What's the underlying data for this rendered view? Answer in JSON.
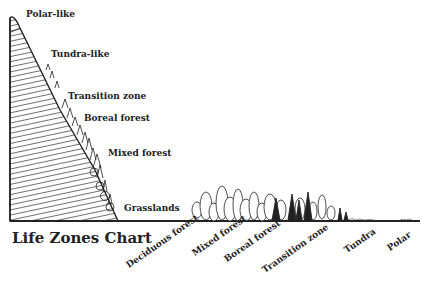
{
  "title": "Life Zones Chart",
  "slope_labels": [
    {
      "label": "Polar-like",
      "x": 26,
      "y": 9
    },
    {
      "label": "Tundra-like",
      "x": 51,
      "y": 49
    },
    {
      "label": "Transition zone",
      "x": 68,
      "y": 91
    },
    {
      "label": "Boreal forest",
      "x": 84,
      "y": 113
    },
    {
      "label": "Mixed forest",
      "x": 108,
      "y": 148
    },
    {
      "label": "Grasslands",
      "x": 124,
      "y": 203
    }
  ],
  "axis_labels": [
    {
      "label": "Deciduous forest",
      "x": 130,
      "y": 272
    },
    {
      "label": "Mixed forest",
      "x": 196,
      "y": 260
    },
    {
      "label": "Boreal forest",
      "x": 225,
      "y": 266
    },
    {
      "label": "Transition zone",
      "x": 266,
      "y": 277
    },
    {
      "label": "Tundra",
      "x": 347,
      "y": 257
    },
    {
      "label": "Polar",
      "x": 388,
      "y": 255
    }
  ],
  "colors": {
    "ink": "#222222",
    "background": "#ffffff"
  }
}
